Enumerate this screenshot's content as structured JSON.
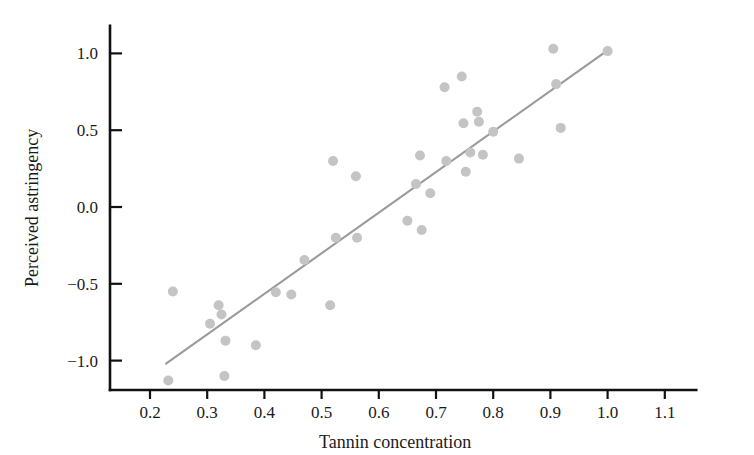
{
  "chart_data": {
    "type": "scatter",
    "title": "",
    "xlabel": "Tannin concentration",
    "ylabel": "Perceived astringency",
    "xlim": [
      0.155,
      1.155
    ],
    "ylim": [
      -1.2,
      1.18
    ],
    "xticks": [
      0.2,
      0.3,
      0.4,
      0.5,
      0.6,
      0.7,
      0.8,
      0.9,
      1.0,
      1.1
    ],
    "xtick_labels": [
      "0.2",
      "0.3",
      "0.4",
      "0.5",
      "0.6",
      "0.7",
      "0.8",
      "0.9",
      "1.0",
      "1.1"
    ],
    "yticks": [
      -1.0,
      -0.5,
      0.0,
      0.5,
      1.0
    ],
    "ytick_labels": [
      "−1.0",
      "−0.5",
      "0.0",
      "0.5",
      "1.0"
    ],
    "grid": false,
    "legend": false,
    "marker_color": "#c4c4c4",
    "marker_size": 5,
    "line_color": "#9a9a9a",
    "axis_color": "#111111",
    "points": [
      [
        0.232,
        -1.13
      ],
      [
        0.24,
        -0.55
      ],
      [
        0.305,
        -0.76
      ],
      [
        0.32,
        -0.64
      ],
      [
        0.325,
        -0.7
      ],
      [
        0.33,
        -1.1
      ],
      [
        0.332,
        -0.87
      ],
      [
        0.385,
        -0.9
      ],
      [
        0.42,
        -0.555
      ],
      [
        0.447,
        -0.57
      ],
      [
        0.47,
        -0.345
      ],
      [
        0.515,
        -0.64
      ],
      [
        0.52,
        0.3
      ],
      [
        0.525,
        -0.2
      ],
      [
        0.56,
        0.2
      ],
      [
        0.562,
        -0.2
      ],
      [
        0.65,
        -0.09
      ],
      [
        0.665,
        0.15
      ],
      [
        0.672,
        0.335
      ],
      [
        0.675,
        -0.15
      ],
      [
        0.69,
        0.09
      ],
      [
        0.715,
        0.78
      ],
      [
        0.718,
        0.3
      ],
      [
        0.745,
        0.85
      ],
      [
        0.748,
        0.545
      ],
      [
        0.752,
        0.23
      ],
      [
        0.76,
        0.355
      ],
      [
        0.772,
        0.62
      ],
      [
        0.775,
        0.555
      ],
      [
        0.782,
        0.34
      ],
      [
        0.8,
        0.49
      ],
      [
        0.845,
        0.315
      ],
      [
        0.905,
        1.03
      ],
      [
        0.91,
        0.8
      ],
      [
        0.918,
        0.515
      ],
      [
        1.0,
        1.015
      ]
    ],
    "regression_line": {
      "x_start": 0.228,
      "y_start": -1.02,
      "x_end": 1.0,
      "y_end": 1.02
    }
  }
}
